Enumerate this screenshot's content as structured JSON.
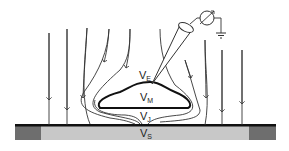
{
  "diagram": {
    "labels": {
      "ve": {
        "main": "V",
        "sub": "E"
      },
      "vm": {
        "main": "V",
        "sub": "M"
      },
      "vj": {
        "main": "V",
        "sub": "J"
      },
      "vs": {
        "main": "V",
        "sub": "S"
      }
    },
    "colors": {
      "line": "#333333",
      "substrate": "#c8c8c8",
      "substrate_edge": "#6e6e6e",
      "bar": "#111111"
    }
  }
}
